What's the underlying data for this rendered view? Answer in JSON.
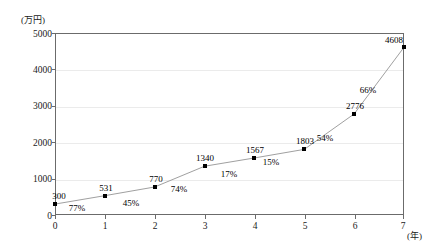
{
  "chart_data": {
    "type": "line",
    "title": "",
    "xlabel": "(年)",
    "ylabel": "(万円)",
    "x": [
      0,
      1,
      2,
      3,
      4,
      5,
      6,
      7
    ],
    "values": [
      300,
      531,
      770,
      1340,
      1567,
      1803,
      2776,
      4608
    ],
    "point_labels": [
      "300",
      "531",
      "770",
      "1340",
      "1567",
      "1803",
      "2776",
      "4608"
    ],
    "growth_labels": [
      "77%",
      "45%",
      "74%",
      "17%",
      "15%",
      "54%",
      "66%"
    ],
    "xlim": [
      0,
      7
    ],
    "ylim": [
      0,
      5000
    ],
    "ytick_labels": [
      "0",
      "1000",
      "2000",
      "3000",
      "4000",
      "5000"
    ],
    "ytick_values": [
      0,
      1000,
      2000,
      3000,
      4000,
      5000
    ],
    "xtick_labels": [
      "0",
      "1",
      "2",
      "3",
      "4",
      "5",
      "6",
      "7"
    ],
    "grid": true,
    "legend": "none",
    "marker": "square",
    "line_color": "#a0a0a0",
    "marker_color": "#000000",
    "grid_color": "#ebebeb",
    "axis_color": "#6b6b6b"
  }
}
